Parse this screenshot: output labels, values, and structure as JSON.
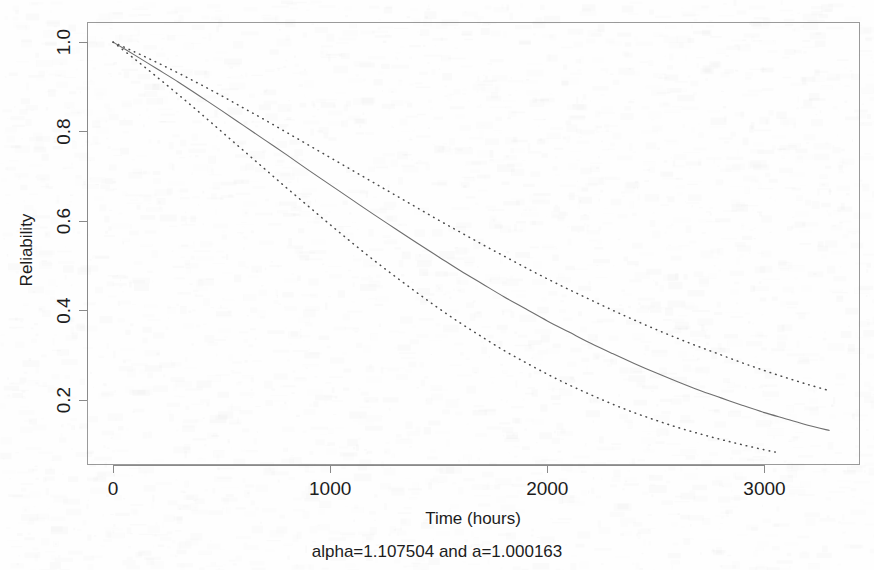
{
  "figure": {
    "background_color": "#fefefe",
    "solid_color": "#6e6e6e",
    "dotted_color": "#4a4a4a",
    "frame_color": "#9a9a9a"
  },
  "labels": {
    "xlabel": "Time (hours)",
    "ylabel": "Reliability",
    "subtitle": "alpha=1.107504 and a=1.000163"
  },
  "chart_data": {
    "type": "line",
    "title": "",
    "subtitle": "alpha=1.107504 and a=1.000163",
    "xlabel": "Time (hours)",
    "ylabel": "Reliability",
    "xlim": [
      -120,
      3440
    ],
    "ylim": [
      0.055,
      1.045
    ],
    "xticks": [
      0,
      1000,
      2000,
      3000
    ],
    "xticklabels": [
      "0",
      "1000",
      "2000",
      "3000"
    ],
    "yticks": [
      0.2,
      0.4,
      0.6,
      0.8,
      1.0
    ],
    "yticklabels": [
      "0.2",
      "0.4",
      "0.6",
      "0.8",
      "1.0"
    ],
    "grid": false,
    "legend": "none",
    "series": [
      {
        "name": "Upper confidence bound",
        "style": "dotted",
        "color": "#4a4a4a",
        "x": [
          0,
          100,
          200,
          300,
          400,
          500,
          600,
          700,
          800,
          900,
          1000,
          1100,
          1200,
          1300,
          1400,
          1500,
          1600,
          1700,
          1800,
          1900,
          2000,
          2100,
          2200,
          2300,
          2400,
          2500,
          2600,
          2700,
          2800,
          2900,
          3000,
          3100,
          3200,
          3300
        ],
        "y": [
          1.0,
          0.978,
          0.955,
          0.931,
          0.906,
          0.88,
          0.853,
          0.826,
          0.798,
          0.77,
          0.742,
          0.714,
          0.686,
          0.658,
          0.63,
          0.602,
          0.575,
          0.548,
          0.522,
          0.496,
          0.471,
          0.447,
          0.424,
          0.401,
          0.379,
          0.358,
          0.338,
          0.319,
          0.301,
          0.283,
          0.266,
          0.25,
          0.235,
          0.221
        ]
      },
      {
        "name": "Reliability estimate",
        "style": "solid",
        "color": "#6e6e6e",
        "x": [
          0,
          100,
          200,
          300,
          400,
          500,
          600,
          700,
          800,
          900,
          1000,
          1100,
          1200,
          1300,
          1400,
          1500,
          1600,
          1700,
          1800,
          1900,
          2000,
          2100,
          2200,
          2300,
          2400,
          2500,
          2600,
          2700,
          2800,
          2900,
          3000,
          3100,
          3200,
          3300
        ],
        "y": [
          1.0,
          0.971,
          0.941,
          0.911,
          0.879,
          0.847,
          0.814,
          0.781,
          0.748,
          0.714,
          0.681,
          0.648,
          0.615,
          0.583,
          0.551,
          0.52,
          0.489,
          0.46,
          0.431,
          0.404,
          0.377,
          0.352,
          0.327,
          0.304,
          0.282,
          0.261,
          0.241,
          0.222,
          0.205,
          0.188,
          0.172,
          0.158,
          0.144,
          0.132
        ]
      },
      {
        "name": "Lower confidence bound",
        "style": "dotted",
        "color": "#4a4a4a",
        "x": [
          0,
          100,
          200,
          300,
          400,
          500,
          600,
          700,
          800,
          900,
          1000,
          1100,
          1200,
          1300,
          1400,
          1500,
          1600,
          1700,
          1800,
          1900,
          2000,
          2100,
          2200,
          2300,
          2400,
          2500,
          2600,
          2700,
          2800,
          2900,
          3000,
          3050
        ],
        "y": [
          1.0,
          0.962,
          0.923,
          0.883,
          0.842,
          0.8,
          0.758,
          0.716,
          0.674,
          0.633,
          0.592,
          0.552,
          0.513,
          0.476,
          0.44,
          0.405,
          0.372,
          0.341,
          0.311,
          0.284,
          0.258,
          0.234,
          0.212,
          0.191,
          0.172,
          0.155,
          0.139,
          0.125,
          0.112,
          0.1,
          0.089,
          0.084
        ]
      }
    ]
  },
  "geometry": {
    "plot_left": 87,
    "plot_right": 860,
    "plot_top": 22,
    "plot_bottom": 465
  }
}
